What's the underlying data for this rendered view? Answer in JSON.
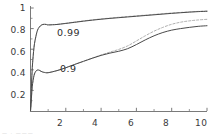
{
  "chart_data": {
    "type": "line",
    "title": "",
    "xlabel": "",
    "ylabel": "",
    "xlim": [
      0,
      10
    ],
    "ylim": [
      0,
      1
    ],
    "grid": false,
    "legend_position": "inline-annotations",
    "xticks": [
      2,
      4,
      6,
      8,
      10
    ],
    "xtick_labels": [
      "2",
      "4",
      "6",
      "8",
      "10"
    ],
    "yticks": [
      0.2,
      0.4,
      0.6,
      0.8,
      1
    ],
    "ytick_labels": [
      "0.2",
      "0.4",
      "0.6",
      "0.8",
      "1"
    ],
    "annotations": [
      {
        "text": "0.99",
        "x": 2.0,
        "y": 0.76
      },
      {
        "text": "0.9",
        "x": 2.1,
        "y": 0.37
      }
    ],
    "series": [
      {
        "name": "0.99",
        "style": "solid",
        "color": "#4a4a4a",
        "x": [
          0,
          0.05,
          0.1,
          0.2,
          0.3,
          0.4,
          0.5,
          0.6,
          0.7,
          0.8,
          0.9,
          1.0,
          1.5,
          2.0,
          2.5,
          3.0,
          3.5,
          4.0,
          4.5,
          5.0,
          5.5,
          6.0,
          6.5,
          7.0,
          7.5,
          8.0,
          8.5,
          9.0,
          9.5,
          10.0
        ],
        "y": [
          0,
          0.22,
          0.42,
          0.62,
          0.72,
          0.785,
          0.815,
          0.832,
          0.84,
          0.842,
          0.84,
          0.836,
          0.84,
          0.85,
          0.861,
          0.872,
          0.882,
          0.891,
          0.899,
          0.906,
          0.913,
          0.92,
          0.927,
          0.934,
          0.941,
          0.948,
          0.954,
          0.96,
          0.965,
          0.968
        ]
      },
      {
        "name": "0.99-dashed",
        "style": "dashed",
        "color": "#9a9a9a",
        "x": [
          0,
          0.05,
          0.1,
          0.2,
          0.3,
          0.4,
          0.5,
          0.6,
          0.7,
          0.8,
          0.9,
          1.0,
          1.5,
          2.0,
          2.5,
          3.0,
          3.5,
          4.0,
          4.5,
          5.0,
          5.5,
          6.0,
          6.5,
          7.0,
          7.5,
          8.0,
          8.5,
          9.0,
          9.5,
          10.0
        ],
        "y": [
          0,
          0.22,
          0.42,
          0.62,
          0.72,
          0.785,
          0.815,
          0.832,
          0.84,
          0.842,
          0.84,
          0.836,
          0.841,
          0.852,
          0.864,
          0.875,
          0.885,
          0.894,
          0.902,
          0.91,
          0.917,
          0.924,
          0.931,
          0.938,
          0.945,
          0.951,
          0.957,
          0.962,
          0.967,
          0.971
        ]
      },
      {
        "name": "0.9",
        "style": "solid",
        "color": "#4a4a4a",
        "x": [
          0,
          0.05,
          0.1,
          0.2,
          0.3,
          0.4,
          0.5,
          0.6,
          0.7,
          0.8,
          1.0,
          1.5,
          2.0,
          2.5,
          3.0,
          3.5,
          4.0,
          4.5,
          5.0,
          5.5,
          6.0,
          6.5,
          7.0,
          7.5,
          8.0,
          8.5,
          9.0,
          9.5,
          10.0
        ],
        "y": [
          0,
          0.12,
          0.24,
          0.345,
          0.385,
          0.398,
          0.395,
          0.385,
          0.378,
          0.374,
          0.372,
          0.392,
          0.42,
          0.452,
          0.482,
          0.512,
          0.54,
          0.562,
          0.58,
          0.605,
          0.645,
          0.69,
          0.73,
          0.762,
          0.785,
          0.8,
          0.812,
          0.822,
          0.828
        ]
      },
      {
        "name": "0.9-dashed",
        "style": "dashed",
        "color": "#9a9a9a",
        "x": [
          0,
          0.05,
          0.1,
          0.2,
          0.3,
          0.4,
          0.5,
          0.6,
          0.7,
          0.8,
          1.0,
          1.5,
          2.0,
          2.5,
          3.0,
          3.5,
          4.0,
          4.5,
          5.0,
          5.5,
          6.0,
          6.5,
          7.0,
          7.5,
          8.0,
          8.5,
          9.0,
          9.5,
          10.0
        ],
        "y": [
          0,
          0.12,
          0.24,
          0.345,
          0.385,
          0.398,
          0.395,
          0.385,
          0.378,
          0.374,
          0.372,
          0.392,
          0.42,
          0.452,
          0.483,
          0.514,
          0.544,
          0.572,
          0.598,
          0.632,
          0.68,
          0.73,
          0.775,
          0.812,
          0.842,
          0.862,
          0.875,
          0.884,
          0.89
        ]
      }
    ],
    "colors": {
      "axis": "#6b6b6b",
      "solid_curve": "#4a4a4a",
      "dashed_curve": "#9a9a9a",
      "background": "#ffffff",
      "tick_text": "#3a3a3a"
    }
  },
  "footer_artifact": {
    "text": "— · ———"
  }
}
